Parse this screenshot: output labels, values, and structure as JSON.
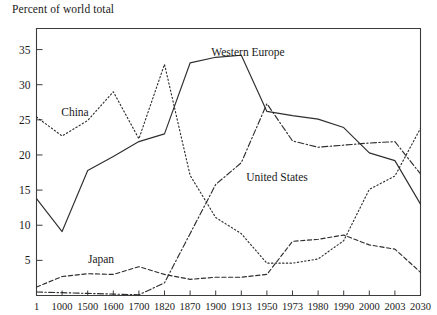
{
  "chart_data": {
    "type": "line",
    "title": "Percent of world total",
    "xlabel": "",
    "ylabel": "",
    "ylim": [
      0,
      38
    ],
    "yticks": [
      5,
      10,
      15,
      20,
      25,
      30,
      35
    ],
    "grid": false,
    "legend_position": "inline-annotations",
    "categories": [
      "1",
      "1000",
      "1500",
      "1600",
      "1700",
      "1820",
      "1870",
      "1900",
      "1913",
      "1950",
      "1973",
      "1980",
      "1990",
      "2000",
      "2003",
      "2030"
    ],
    "series": [
      {
        "name": "China",
        "style": "dotted",
        "label_x_category": "1000",
        "values": [
          25.4,
          22.7,
          24.9,
          29.0,
          22.3,
          32.9,
          17.1,
          11.1,
          8.8,
          4.6,
          4.6,
          5.2,
          7.8,
          15.1,
          17.0,
          23.8
        ]
      },
      {
        "name": "Western Europe",
        "style": "solid",
        "label_x_category": "1870",
        "values": [
          13.8,
          9.1,
          17.8,
          19.8,
          21.9,
          23.0,
          33.1,
          33.9,
          34.2,
          26.2,
          25.6,
          25.1,
          23.9,
          20.3,
          19.2,
          13.0
        ]
      },
      {
        "name": "United States",
        "style": "dash-dot",
        "label_x_category": "1913",
        "values": [
          0.5,
          0.4,
          0.3,
          0.2,
          0.1,
          1.8,
          8.8,
          15.8,
          18.9,
          27.3,
          22.0,
          21.1,
          21.4,
          21.7,
          21.9,
          17.3
        ]
      },
      {
        "name": "Japan",
        "style": "dashed",
        "label_x_category": "1500",
        "values": [
          1.2,
          2.7,
          3.1,
          3.0,
          4.1,
          3.0,
          2.3,
          2.6,
          2.6,
          3.0,
          7.7,
          8.0,
          8.6,
          7.2,
          6.6,
          3.3
        ]
      }
    ]
  },
  "annotations": [
    {
      "text": "China",
      "x": 75,
      "y": 116
    },
    {
      "text": "Western Europe",
      "x": 248,
      "y": 56
    },
    {
      "text": "United States",
      "x": 277,
      "y": 181
    },
    {
      "text": "Japan",
      "x": 101,
      "y": 263
    }
  ],
  "axes": {
    "y_tick_labels": [
      "35",
      "30",
      "25",
      "20",
      "15",
      "10",
      "5"
    ],
    "x_tick_labels": [
      "1",
      "1000",
      "1500",
      "1600",
      "1700",
      "1820",
      "1870",
      "1900",
      "1913",
      "1950",
      "1973",
      "1980",
      "1990",
      "2000",
      "2003",
      "2030"
    ]
  }
}
